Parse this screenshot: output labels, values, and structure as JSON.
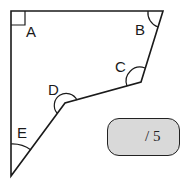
{
  "diagram": {
    "type": "pentagon-angles",
    "vertices": [
      {
        "id": "A",
        "x": 11,
        "y": 11,
        "angle": "right"
      },
      {
        "id": "B",
        "x": 163,
        "y": 11,
        "angle": "acute"
      },
      {
        "id": "C",
        "x": 141,
        "y": 82,
        "angle": "obtuse"
      },
      {
        "id": "D",
        "x": 65,
        "y": 103,
        "angle": "reflex"
      },
      {
        "id": "E",
        "x": 11,
        "y": 176,
        "angle": "acute"
      }
    ],
    "labels": {
      "A": "A",
      "B": "B",
      "C": "C",
      "D": "D",
      "E": "E"
    }
  },
  "score": {
    "value": "",
    "label": "/ 5",
    "fill_color": "#d9d9d9"
  }
}
